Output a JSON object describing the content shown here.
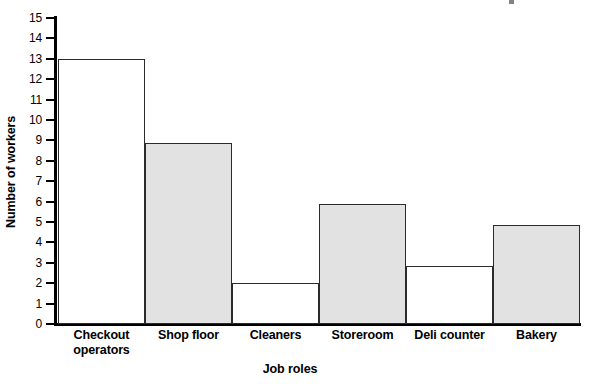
{
  "chart_data": {
    "type": "bar",
    "title": "",
    "subtitle": "",
    "xlabel": "Job roles",
    "ylabel": "Number of workers",
    "categories": [
      "Checkout operators",
      "Shop floor",
      "Cleaners",
      "Storeroom",
      "Deli counter",
      "Bakery"
    ],
    "values": [
      13,
      8.85,
      2,
      5.9,
      2.85,
      4.85
    ],
    "ylim": [
      0,
      15
    ],
    "ytick_labels": [
      "15",
      "14",
      "13",
      "12",
      "11",
      "10",
      "9",
      "8",
      "7",
      "6",
      "5",
      "4",
      "3",
      "2",
      "1",
      "0"
    ],
    "ytick_values": [
      15,
      14,
      13,
      12,
      11,
      10,
      9,
      8,
      7,
      6,
      5,
      4,
      3,
      2,
      1,
      0
    ],
    "grid": false,
    "legend": false,
    "legend_position": "none",
    "bar_style": "contiguous-histogram",
    "colors": {
      "bar_fill_filled": "#e2e2e2",
      "bar_fill_empty": "#ffffff",
      "bar_border": "#2b2b2b",
      "axis": "#000000",
      "text": "#000000",
      "background": "#ffffff"
    }
  },
  "axes": {
    "y_title": "Number of workers",
    "x_title": "Job roles"
  }
}
